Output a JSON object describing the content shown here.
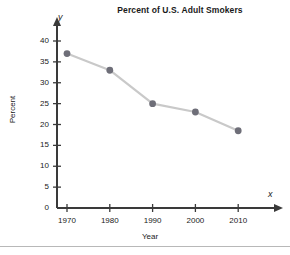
{
  "chart_data": {
    "type": "line",
    "title": "Percent of U.S. Adult Smokers",
    "xlabel": "Year",
    "ylabel": "Percent",
    "x_axis_letter": "x",
    "y_axis_letter": "y",
    "categories": [
      1970,
      1980,
      1990,
      2000,
      2010
    ],
    "x_tick_labels": [
      "1970",
      "1980",
      "1990",
      "2000",
      "2010"
    ],
    "values": [
      37,
      33,
      25,
      23,
      18.5
    ],
    "y_tick_labels": [
      "0",
      "5",
      "10",
      "15",
      "20",
      "25",
      "30",
      "35",
      "40"
    ],
    "y_ticks": [
      0,
      5,
      10,
      15,
      20,
      25,
      30,
      35,
      40
    ],
    "xlim": [
      1965,
      2015
    ],
    "ylim": [
      0,
      42
    ],
    "grid": false,
    "legend": false,
    "marker": "circle",
    "line_color": "#c9c9c9",
    "marker_color": "#6e6e78",
    "axis_color": "#3a3a3a",
    "text_color": "#1a1a1a"
  }
}
